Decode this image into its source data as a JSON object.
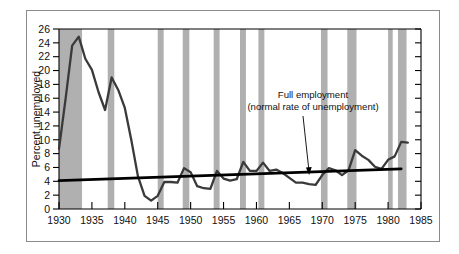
{
  "chart_data": {
    "type": "line",
    "title": "",
    "xlabel": "",
    "ylabel": "Percent unemployed",
    "xlim": [
      1930,
      1985
    ],
    "ylim": [
      0,
      26
    ],
    "xticks": [
      1930,
      1935,
      1940,
      1945,
      1950,
      1955,
      1960,
      1965,
      1970,
      1975,
      1980,
      1985
    ],
    "yticks": [
      0,
      2,
      4,
      6,
      8,
      10,
      12,
      14,
      16,
      18,
      20,
      22,
      24,
      26
    ],
    "grid": false,
    "legend_position": "none",
    "series": [
      {
        "name": "Unemployment rate",
        "color": "#3a3a3a",
        "x": [
          1930,
          1931,
          1932,
          1933,
          1934,
          1935,
          1936,
          1937,
          1938,
          1939,
          1940,
          1941,
          1942,
          1943,
          1944,
          1945,
          1946,
          1947,
          1948,
          1949,
          1950,
          1951,
          1952,
          1953,
          1954,
          1955,
          1956,
          1957,
          1958,
          1959,
          1960,
          1961,
          1962,
          1963,
          1964,
          1965,
          1966,
          1967,
          1968,
          1969,
          1970,
          1971,
          1972,
          1973,
          1974,
          1975,
          1976,
          1977,
          1978,
          1979,
          1980,
          1981,
          1982,
          1983
        ],
        "values": [
          8.7,
          15.9,
          23.6,
          24.9,
          21.7,
          20.1,
          16.9,
          14.3,
          19.0,
          17.2,
          14.6,
          9.9,
          4.7,
          1.9,
          1.2,
          1.9,
          3.9,
          3.9,
          3.8,
          5.9,
          5.3,
          3.3,
          3.0,
          2.9,
          5.5,
          4.4,
          4.1,
          4.3,
          6.8,
          5.5,
          5.5,
          6.7,
          5.5,
          5.7,
          5.2,
          4.5,
          3.8,
          3.8,
          3.6,
          3.5,
          4.9,
          5.9,
          5.6,
          4.9,
          5.6,
          8.5,
          7.7,
          7.1,
          6.1,
          5.8,
          7.1,
          7.6,
          9.7,
          9.6
        ]
      },
      {
        "name": "Full employment (natural rate)",
        "color": "#000000",
        "x": [
          1930,
          1982
        ],
        "values": [
          4.1,
          5.8
        ]
      }
    ],
    "annotations": [
      {
        "name": "full-employment-label",
        "line1": "Full employment",
        "line2": "(normal rate of unemployment)",
        "points_to_year": 1968,
        "points_to_value": 4.9
      }
    ],
    "shaded_bands": {
      "name": "recession-bands",
      "color": "#b0b0b0",
      "ranges": [
        [
          1930.0,
          1933.5
        ],
        [
          1937.4,
          1938.4
        ],
        [
          1945.0,
          1945.9
        ],
        [
          1948.8,
          1949.8
        ],
        [
          1953.5,
          1954.4
        ],
        [
          1957.5,
          1958.4
        ],
        [
          1960.3,
          1961.2
        ],
        [
          1969.8,
          1970.8
        ],
        [
          1973.8,
          1975.2
        ],
        [
          1980.0,
          1980.7
        ],
        [
          1981.5,
          1982.8
        ]
      ]
    }
  }
}
